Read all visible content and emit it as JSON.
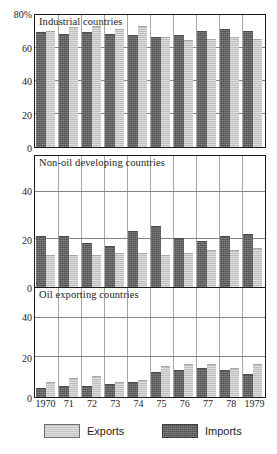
{
  "chart_data": {
    "type": "bar",
    "title": "",
    "xlabel": "",
    "ylabel": "",
    "grid": true,
    "legend_position": "bottom",
    "categories": [
      "1970",
      "71",
      "72",
      "73",
      "74",
      "75",
      "76",
      "77",
      "78",
      "1979"
    ],
    "legend": [
      {
        "name": "Exports",
        "color": "#c4c4c0"
      },
      {
        "name": "Imports",
        "color": "#676767"
      }
    ],
    "panels": [
      {
        "title": "Industrial countries",
        "ylim": [
          0,
          80
        ],
        "yticks": [
          {
            "value": 80,
            "label": "80%"
          },
          {
            "value": 60,
            "label": "60"
          },
          {
            "value": 40,
            "label": "40"
          },
          {
            "value": 20,
            "label": "20"
          },
          {
            "value": 0,
            "label": "0"
          }
        ],
        "series": [
          {
            "name": "Exports",
            "values": [
              70,
              72,
              73,
              71,
              73,
              66,
              64,
              65,
              66,
              65
            ]
          },
          {
            "name": "Imports",
            "values": [
              69,
              68,
              69,
              68,
              67,
              66,
              67,
              70,
              71,
              70
            ]
          }
        ]
      },
      {
        "title": "Non-oil developing countries",
        "ylim": [
          0,
          55
        ],
        "yticks": [
          {
            "value": 40,
            "label": "40"
          },
          {
            "value": 20,
            "label": "20"
          },
          {
            "value": 0,
            "label": "0"
          }
        ],
        "series": [
          {
            "name": "Exports",
            "values": [
              13,
              13,
              13,
              14,
              14,
              13,
              14,
              15,
              15,
              16
            ]
          },
          {
            "name": "Imports",
            "values": [
              21,
              21,
              18,
              17,
              23,
              25,
              20,
              19,
              21,
              22
            ]
          }
        ]
      },
      {
        "title": "Oil exporting countries",
        "ylim": [
          0,
          55
        ],
        "yticks": [
          {
            "value": 40,
            "label": "40"
          },
          {
            "value": 20,
            "label": "20"
          },
          {
            "value": 0,
            "label": "0"
          }
        ],
        "series": [
          {
            "name": "Exports",
            "values": [
              7,
              9,
              10,
              7,
              8,
              15,
              16,
              16,
              14,
              16
            ]
          },
          {
            "name": "Imports",
            "values": [
              4,
              5,
              5,
              6,
              7,
              12,
              13,
              14,
              13,
              11
            ]
          }
        ]
      }
    ]
  }
}
